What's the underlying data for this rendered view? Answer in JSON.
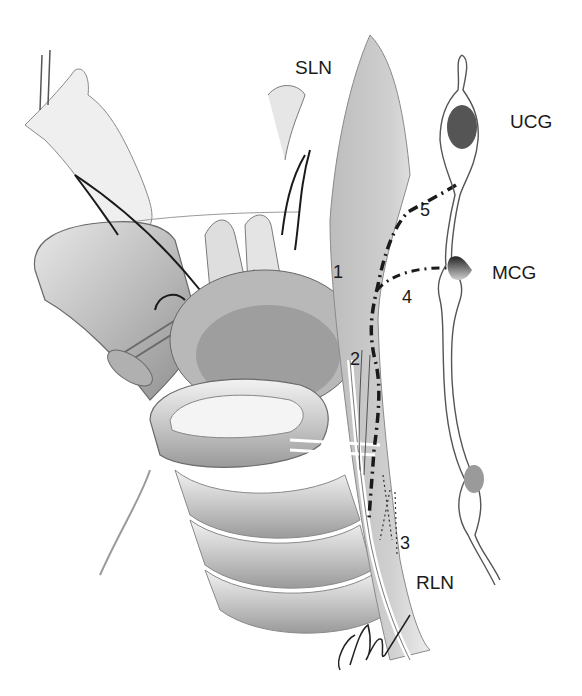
{
  "figure": {
    "type": "anatomical-illustration",
    "colors": {
      "background": "#ffffff",
      "ink": "#1a1a1a",
      "shade_dark": "#6a6a6a",
      "shade_mid": "#a8a8a8",
      "shade_light": "#d9d9d9",
      "ganglion_dark": "#555555",
      "ganglion_light": "#9a9a9a"
    }
  },
  "labels": {
    "sln": "SLN",
    "ucg": "UCG",
    "mcg": "MCG",
    "rln": "RLN",
    "n1": "1",
    "n2": "2",
    "n3": "3",
    "n4": "4",
    "n5": "5"
  }
}
